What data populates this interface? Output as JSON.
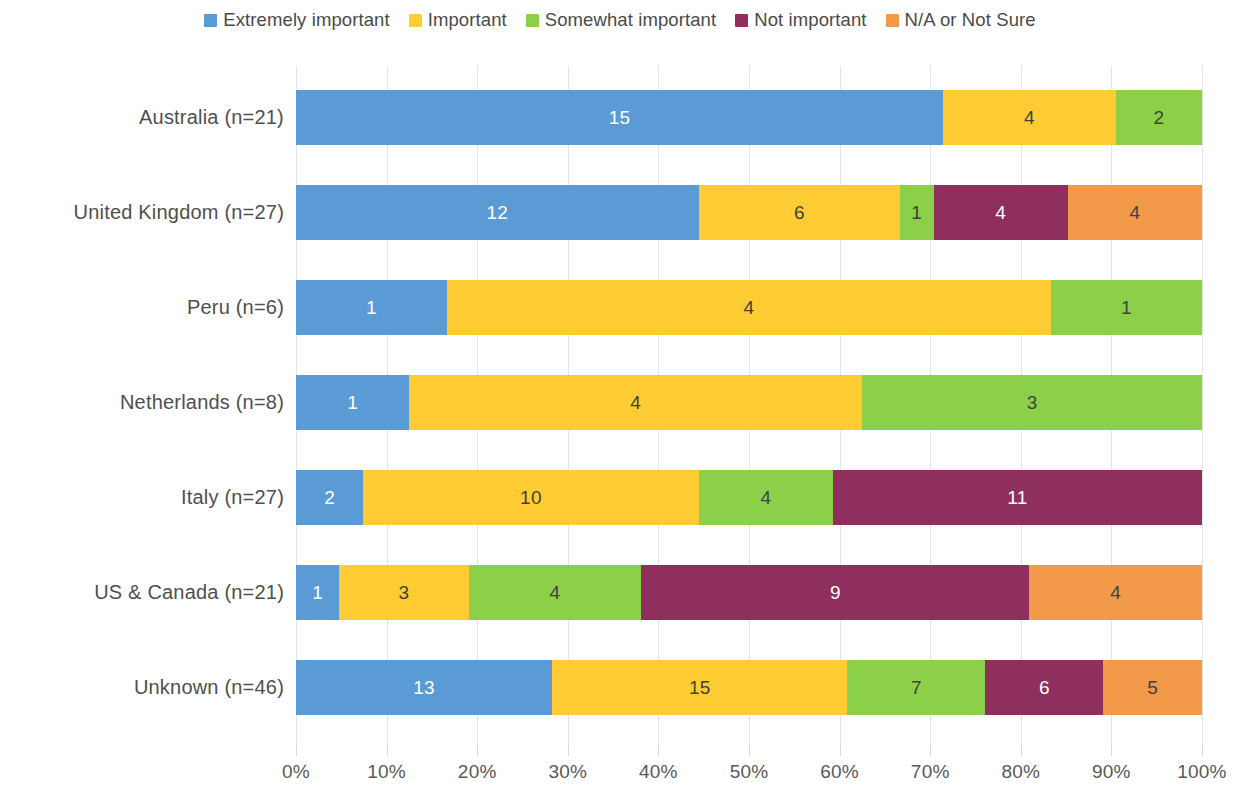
{
  "chart_data": {
    "type": "bar",
    "subtype": "100% stacked horizontal bar",
    "title": "",
    "subtitle": "",
    "xlabel": "",
    "ylabel": "",
    "xlim": [
      0,
      100
    ],
    "xunit": "%",
    "grid": true,
    "legend_position": "top",
    "orientation": "horizontal",
    "stacked": true,
    "normalized": true,
    "x_ticks": [
      "0%",
      "10%",
      "20%",
      "30%",
      "40%",
      "50%",
      "60%",
      "70%",
      "80%",
      "90%",
      "100%"
    ],
    "x_tick_values": [
      0,
      10,
      20,
      30,
      40,
      50,
      60,
      70,
      80,
      90,
      100
    ],
    "categories": [
      "Australia (n=21)",
      "United Kingdom (n=27)",
      "Peru (n=6)",
      "Netherlands (n=8)",
      "Italy (n=27)",
      "US & Canada (n=21)",
      "Unknown (n=46)"
    ],
    "category_totals": [
      21,
      27,
      6,
      8,
      27,
      21,
      46
    ],
    "series": [
      {
        "name": "Extremely important",
        "color": "#5B9BD5",
        "label_color": "#ffffff",
        "values": [
          15,
          12,
          1,
          1,
          2,
          1,
          13
        ]
      },
      {
        "name": "Important",
        "color": "#FFCC33",
        "label_color": "#404040",
        "values": [
          4,
          6,
          4,
          4,
          10,
          3,
          15
        ]
      },
      {
        "name": "Somewhat important",
        "color": "#8CD04A",
        "label_color": "#404040",
        "values": [
          2,
          1,
          1,
          3,
          4,
          4,
          7
        ]
      },
      {
        "name": "Not important",
        "color": "#8E2F5E",
        "label_color": "#ffffff",
        "values": [
          0,
          4,
          0,
          0,
          11,
          9,
          6
        ]
      },
      {
        "name": "N/A or Not Sure",
        "color": "#F2994A",
        "label_color": "#404040",
        "values": [
          0,
          4,
          0,
          0,
          0,
          4,
          5
        ]
      }
    ]
  },
  "legend": {
    "items": [
      {
        "label": "Extremely important",
        "color": "#5B9BD5"
      },
      {
        "label": "Important",
        "color": "#FFCC33"
      },
      {
        "label": "Somewhat important",
        "color": "#8CD04A"
      },
      {
        "label": "Not important",
        "color": "#8E2F5E"
      },
      {
        "label": "N/A or Not Sure",
        "color": "#F2994A"
      }
    ]
  }
}
